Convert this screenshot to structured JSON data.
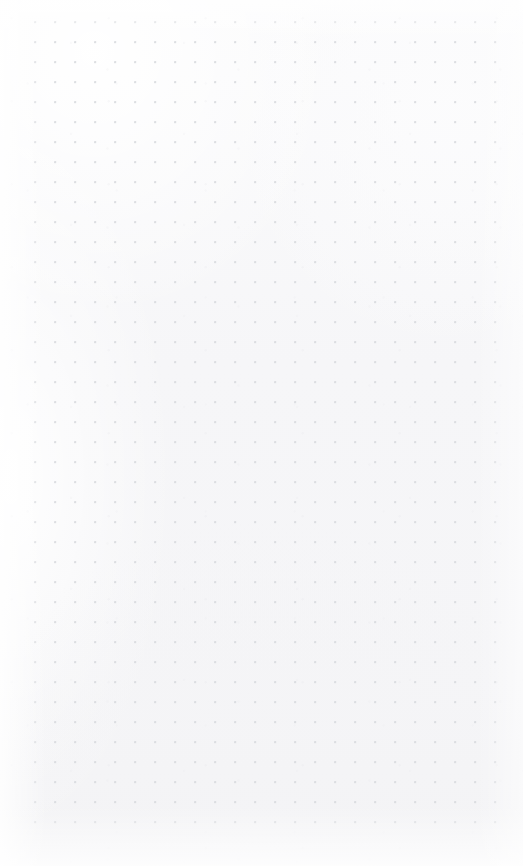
{
  "page": {
    "kind": "dot-grid-sheet",
    "title": "",
    "width": 523,
    "height": 866,
    "background_color": "#f8f8f9",
    "has_text_content": false,
    "visible_text": ""
  },
  "grid": {
    "dot_color": "#d7d9dd",
    "dot_diameter": 1.6,
    "spacing_x": 20,
    "spacing_y": 20,
    "origin_x": 35,
    "origin_y": 22,
    "columns": 24,
    "rows": 41,
    "first_dot_x": 35,
    "first_dot_y": 22,
    "last_dot_x": 495,
    "last_dot_y": 822
  },
  "margins": {
    "left": 35,
    "right": 28,
    "top": 22,
    "bottom": 44
  }
}
